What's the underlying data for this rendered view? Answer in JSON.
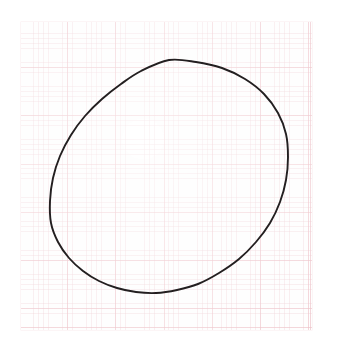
{
  "image": {
    "kind": "scanned-drawing",
    "subject": "hand-drawn circle on graph paper",
    "width": 338,
    "height": 351,
    "background_color": "#ffffff"
  },
  "paper": {
    "label": "graph-paper sheet",
    "color": "#fefdfd",
    "left": 21,
    "top": 22,
    "width": 291,
    "height": 308,
    "grid": {
      "minor_spacing_px": 4.82,
      "major_spacing_px": 48.2,
      "minor_color": "#e4b2ba",
      "major_color": "#e2969f",
      "squares_per_major": 10
    }
  },
  "drawing": {
    "shape_label": "circle",
    "stroke_color": "#231f20",
    "stroke_width_px": 1.9,
    "center_x": 169,
    "center_y": 177,
    "radius_x": 119,
    "radius_y": 117,
    "bounds": {
      "left": 50,
      "top": 60,
      "right": 288,
      "bottom": 293
    },
    "note": "freehand, slightly irregular outline"
  },
  "chart_data": {
    "type": "scatter",
    "title": "",
    "xlabel": "",
    "ylabel": "",
    "grid": true,
    "legend": null,
    "xlim": [
      21,
      312
    ],
    "ylim": [
      22,
      330
    ],
    "series": [
      {
        "name": "circle-outline",
        "closed": true,
        "x": [
          169,
          196,
          222,
          245,
          264,
          278,
          286,
          288,
          286,
          280,
          270,
          256,
          239,
          219,
          198,
          177,
          156,
          136,
          117,
          99,
          83,
          69,
          58,
          51,
          50,
          53,
          60,
          71,
          85,
          102,
          121,
          141,
          169
        ],
        "y": [
          60,
          62,
          68,
          79,
          94,
          113,
          134,
          157,
          180,
          202,
          223,
          242,
          259,
          273,
          284,
          290,
          293,
          292,
          288,
          281,
          271,
          258,
          242,
          223,
          201,
          178,
          156,
          135,
          116,
          99,
          84,
          71,
          60
        ]
      }
    ]
  }
}
